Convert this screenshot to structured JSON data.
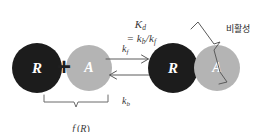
{
  "diagram": {
    "type": "receptor-agonist-binding-equilibrium",
    "background_color": "#ffffff",
    "equation": {
      "text": "Kd = kb/kf",
      "display": "Kd = kb/kf",
      "parts": {
        "constant": "K",
        "constant_subscript": "d",
        "numerator": "k",
        "numerator_subscript": "b",
        "denominator": "k",
        "denominator_subscript": "f"
      }
    },
    "nodes": [
      {
        "id": "receptor-free",
        "label": "R",
        "color": "#1c1c1c",
        "text_color": "#ffffff",
        "role": "free receptor"
      },
      {
        "id": "agonist-free",
        "label": "A",
        "color": "#b4b4b4",
        "text_color": "#ffffff",
        "role": "free agonist"
      },
      {
        "id": "receptor-bound",
        "label": "R",
        "color": "#1c1c1c",
        "text_color": "#ffffff",
        "role": "bound receptor"
      },
      {
        "id": "agonist-bound",
        "label": "A",
        "color": "#b4b4b4",
        "text_color": "#ffffff",
        "role": "bound agonist"
      }
    ],
    "operator": {
      "plus": "+"
    },
    "arrows": {
      "forward": {
        "direction": "right",
        "rate_symbol": "k",
        "rate_subscript": "f",
        "label": "kf"
      },
      "backward": {
        "direction": "left",
        "rate_symbol": "k",
        "rate_subscript": "b",
        "label": "kb"
      }
    },
    "annotations": [
      {
        "id": "free-receptor-brace",
        "label": "f (R)",
        "label_parts": {
          "function": "f",
          "argument": "R"
        },
        "position": "below-left-pair",
        "brace_orientation": "underbrace"
      },
      {
        "id": "inactive-brace",
        "label": "비활성",
        "position": "right-of-complex",
        "brace_orientation": "right-pointing"
      }
    ],
    "stroke_color": "#5a5a5a"
  }
}
